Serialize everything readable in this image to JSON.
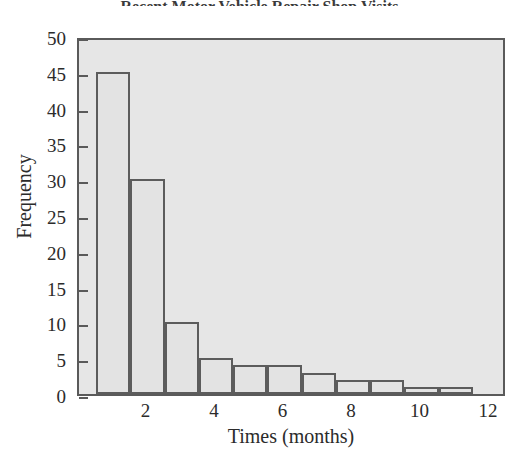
{
  "figure": {
    "title_remnant": "Recent Motor Vehicle Repair Shop Visits",
    "background_color": "#ffffff",
    "plot_background_color": "#e6e6e6",
    "frame_color": "#5a5a5a",
    "bar_edge_color": "#5c5c5c",
    "bar_fill_color": "#e3e3e3"
  },
  "chart_data": {
    "type": "bar",
    "title": "",
    "xlabel": "Times (months)",
    "ylabel": "Frequency",
    "xlim": [
      0,
      12.5
    ],
    "ylim": [
      0,
      50
    ],
    "grid": false,
    "legend": null,
    "bin_width": 1,
    "bin_edges": [
      0.5,
      1.5,
      2.5,
      3.5,
      4.5,
      5.5,
      6.5,
      7.5,
      8.5,
      9.5,
      10.5,
      11.5
    ],
    "categories": [
      "0.5-1.5",
      "1.5-2.5",
      "2.5-3.5",
      "3.5-4.5",
      "4.5-5.5",
      "5.5-6.5",
      "6.5-7.5",
      "7.5-8.5",
      "8.5-9.5",
      "9.5-10.5",
      "10.5-11.5"
    ],
    "values": [
      45,
      30,
      10,
      5,
      4,
      4,
      3,
      2,
      2,
      1,
      1
    ],
    "x_ticks": [
      2,
      4,
      6,
      8,
      10,
      12
    ],
    "x_tick_labels": [
      "2",
      "4",
      "6",
      "8",
      "10",
      "12"
    ],
    "y_ticks": [
      0,
      5,
      10,
      15,
      20,
      25,
      30,
      35,
      40,
      45,
      50
    ],
    "y_tick_labels": [
      "0",
      "5",
      "10",
      "15",
      "20",
      "25",
      "30",
      "35",
      "40",
      "45",
      "50"
    ]
  }
}
